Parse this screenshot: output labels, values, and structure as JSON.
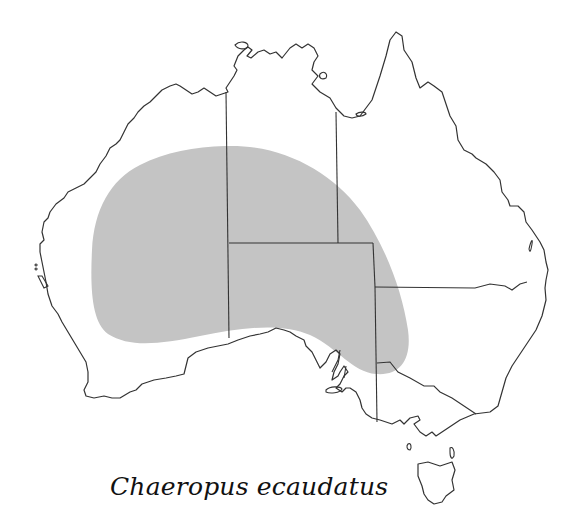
{
  "map": {
    "region": "Australia",
    "species_name": "Chaeropus ecaudatus",
    "range_fill_color": "#c4c4c4",
    "coast_color": "#333333",
    "border_color": "#333333",
    "states": [
      "Western Australia",
      "Northern Territory",
      "South Australia",
      "Queensland",
      "New South Wales",
      "Victoria",
      "Tasmania"
    ],
    "shaded_range_description": "Central and southern arid Australia spanning Western Australia, Northern Territory, South Australia, western New South Wales and north-west Victoria"
  }
}
